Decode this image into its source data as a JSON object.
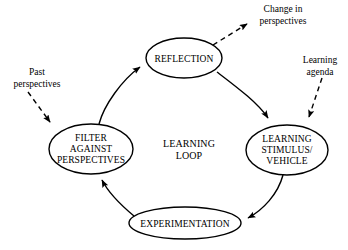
{
  "diagram": {
    "title": "Learning Loop",
    "center_label": {
      "lines": [
        "LEARNING",
        "LOOP"
      ],
      "line1": "LEARNING",
      "line2": "LOOP"
    },
    "colors": {
      "stroke": "#000000",
      "fill": "#ffffff",
      "background": "#ffffff"
    },
    "nodes": [
      {
        "id": "reflection",
        "lines": [
          "REFLECTION"
        ],
        "line1": "REFLECTION",
        "cx": 184,
        "cy": 58,
        "rx": 38,
        "ry": 20
      },
      {
        "id": "learning-stimulus-vehicle",
        "lines": [
          "LEARNING",
          "STIMULUS/",
          "VEHICLE"
        ],
        "line1": "LEARNING",
        "line2": "STIMULUS/",
        "line3": "VEHICLE",
        "cx": 287,
        "cy": 150,
        "rx": 41,
        "ry": 25
      },
      {
        "id": "experimentation",
        "lines": [
          "EXPERIMENTATION"
        ],
        "line1": "EXPERIMENTATION",
        "cx": 185,
        "cy": 223,
        "rx": 56,
        "ry": 16
      },
      {
        "id": "filter-against-perspectives",
        "lines": [
          "FILTER",
          "AGAINST",
          "PERSPECTIVES"
        ],
        "line1": "FILTER",
        "line2": "AGAINST",
        "line3": "PERSPECTIVES",
        "cx": 91,
        "cy": 149,
        "rx": 42,
        "ry": 25
      }
    ],
    "flow_arrows": [
      {
        "id": "filter-to-reflection",
        "from": "filter-against-perspectives",
        "to": "reflection",
        "style": "solid-curved"
      },
      {
        "id": "reflection-to-stimulus",
        "from": "reflection",
        "to": "learning-stimulus-vehicle",
        "style": "solid-curved"
      },
      {
        "id": "stimulus-to-experimentation",
        "from": "learning-stimulus-vehicle",
        "to": "experimentation",
        "style": "solid-curved"
      },
      {
        "id": "experimentation-to-filter",
        "from": "experimentation",
        "to": "filter-against-perspectives",
        "style": "solid-curved"
      }
    ],
    "external_labels": [
      {
        "id": "change-in-perspectives",
        "lines": [
          "Change in",
          "perspectives"
        ],
        "line1": "Change in",
        "line2": "perspectives",
        "x": 283,
        "y": 10,
        "direction": "outgoing",
        "connects_to": "reflection"
      },
      {
        "id": "learning-agenda",
        "lines": [
          "Learning",
          "agenda"
        ],
        "line1": "Learning",
        "line2": "agenda",
        "x": 320,
        "y": 60,
        "direction": "incoming",
        "connects_to": "learning-stimulus-vehicle"
      },
      {
        "id": "past-perspectives",
        "lines": [
          "Past",
          "perspectives"
        ],
        "line1": "Past",
        "line2": "perspectives",
        "x": 37,
        "y": 72,
        "direction": "incoming",
        "connects_to": "filter-against-perspectives"
      }
    ]
  }
}
